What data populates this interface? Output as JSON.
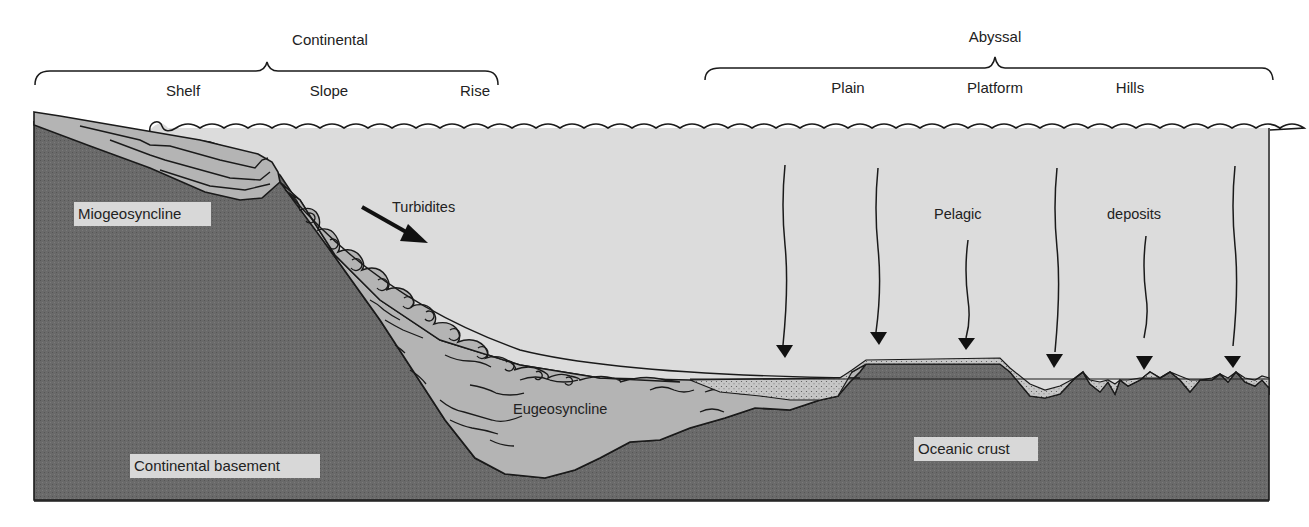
{
  "diagram": {
    "colors": {
      "background": "#ffffff",
      "water": "#dcdcdc",
      "sediment": "#b4b4b4",
      "basement": "#6a6a6a",
      "pelagic_fill": "#c4c4c4",
      "line": "#1a1a1a",
      "label_box": "#d8d8d8"
    },
    "brackets": [
      {
        "name": "continental",
        "label": "Continental",
        "subdivisions": [
          "Shelf",
          "Slope",
          "Rise"
        ]
      },
      {
        "name": "abyssal",
        "label": "Abyssal",
        "subdivisions": [
          "Plain",
          "Platform",
          "Hills"
        ]
      }
    ],
    "layers": {
      "miogeosyncline": "Miogeosyncline",
      "eugeosyncline": "Eugeosyncline",
      "continental_basement": "Continental basement",
      "oceanic_crust": "Oceanic crust"
    },
    "processes": {
      "turbidites": "Turbidites",
      "pelagic": "Pelagic",
      "deposits": "deposits"
    },
    "pelagic_arrow_count": 7,
    "icons": [
      "turbidite-arrow-icon",
      "pelagic-arrow-icon",
      "wave-icon",
      "brace-icon"
    ]
  }
}
